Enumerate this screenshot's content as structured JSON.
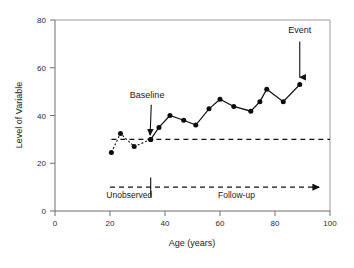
{
  "chart_data": {
    "type": "line",
    "title": "",
    "xlabel": "Age (years)",
    "ylabel": "Level of Variable",
    "xlim": [
      0,
      100
    ],
    "ylim": [
      0,
      80
    ],
    "xticks": [
      0,
      20,
      40,
      60,
      80,
      100
    ],
    "yticks": [
      0,
      20,
      40,
      60,
      80
    ],
    "grid": false,
    "legend": "none",
    "series": [
      {
        "name": "Unobserved",
        "style": "dotted",
        "marker": "filled-circle",
        "x": [
          20.5,
          23.8,
          28.8,
          34.8
        ],
        "values": [
          24.5,
          32.5,
          27.0,
          30.0
        ]
      },
      {
        "name": "Follow-up",
        "style": "solid",
        "marker": "filled-circle",
        "x": [
          34.8,
          37.8,
          41.8,
          46.8,
          51.2,
          56.0,
          60.0,
          65.0,
          71.2,
          74.5,
          77.0,
          83.0,
          89.0
        ],
        "values": [
          30.0,
          35.0,
          40.0,
          38.0,
          36.0,
          42.8,
          46.8,
          43.8,
          41.8,
          45.8,
          51.0,
          45.8,
          53.0
        ]
      }
    ],
    "reference_lines": [
      {
        "name": "baseline-level",
        "orientation": "horizontal",
        "value": 30,
        "style": "dashed",
        "x_start": 20.5,
        "x_end": 100
      },
      {
        "name": "observation-timeline",
        "orientation": "horizontal",
        "value": 10,
        "style": "dashed-arrow",
        "x_start": 20.0,
        "x_end": 96.0
      }
    ],
    "period_divider": {
      "name": "baseline-divider",
      "x": 34.8,
      "y_center": 10,
      "half_height": 4
    },
    "annotations": [
      {
        "name": "baseline",
        "label": "Baseline",
        "text_x": 33.5,
        "text_y": 47.5,
        "arrow_from_x": 35.0,
        "arrow_from_y": 44.5,
        "arrow_to_x": 34.6,
        "arrow_to_y": 31.8
      },
      {
        "name": "event",
        "label": "Event",
        "text_x": 89.0,
        "text_y": 74.5,
        "arrow_from_x": 89.0,
        "arrow_from_y": 71.0,
        "arrow_to_x": 89.0,
        "arrow_to_y": 56.0
      }
    ],
    "period_labels": [
      {
        "name": "unobserved",
        "label": "Unobserved",
        "x": 27.0,
        "y": 5.5
      },
      {
        "name": "follow-up",
        "label": "Follow-up",
        "x": 66.0,
        "y": 5.5
      }
    ]
  },
  "axis": {
    "x_title": "Age (years)",
    "y_title": "Level of Variable",
    "x_tick_labels": [
      "0",
      "20",
      "40",
      "60",
      "80",
      "100"
    ],
    "y_tick_labels": [
      "0",
      "20",
      "40",
      "60",
      "80"
    ]
  },
  "colors": {
    "background": "#ffffff",
    "series": "#101010",
    "axis": "#6f6f6f",
    "frame": "#9a9a9a",
    "text": "#1a1a1a"
  }
}
